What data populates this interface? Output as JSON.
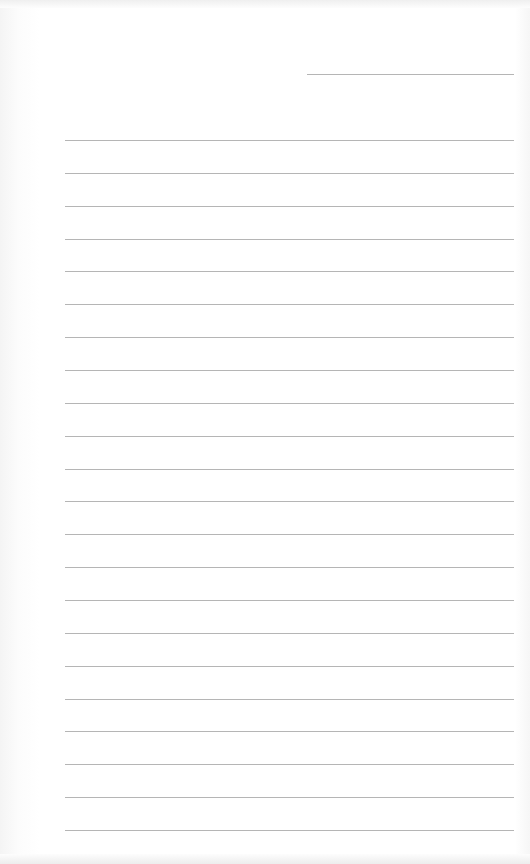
{
  "page": {
    "type": "lined-paper",
    "background": "#ffffff",
    "line_color": "#a8a8a8",
    "header_line": {
      "x": 307,
      "y": 74,
      "width": 207
    },
    "ruled_lines": {
      "count": 22,
      "start_y": 140,
      "spacing": 32.86,
      "left": 65,
      "right": 514
    }
  }
}
